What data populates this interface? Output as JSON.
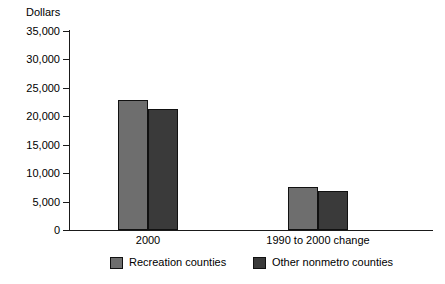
{
  "chart_data": {
    "type": "bar",
    "title": "",
    "xlabel": "",
    "ylabel": "Dollars",
    "categories": [
      "2000",
      "1990 to 2000 change"
    ],
    "series": [
      {
        "name": "Recreation counties",
        "values": [
          22950,
          7560
        ],
        "color": "#6e6e6e"
      },
      {
        "name": "Other nonmetro counties",
        "values": [
          21200,
          6860
        ],
        "color": "#3a3a3a"
      }
    ],
    "ylim": [
      0,
      35000
    ],
    "yticks": [
      0,
      5000,
      10000,
      15000,
      20000,
      25000,
      30000,
      35000
    ],
    "ytick_labels": [
      "0",
      "5,000",
      "10,000",
      "15,000",
      "20,000",
      "25,000",
      "30,000",
      "35,000"
    ],
    "grid": false,
    "legend_position": "bottom"
  }
}
